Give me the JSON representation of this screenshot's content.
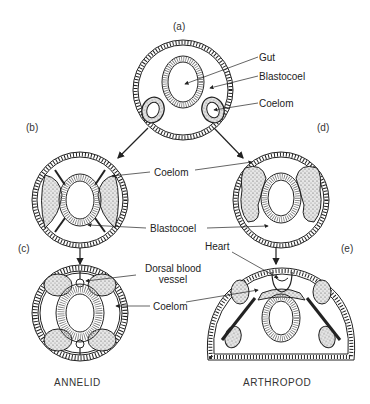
{
  "figure": {
    "panels": {
      "a": "(a)",
      "b": "(b)",
      "c": "(c)",
      "d": "(d)",
      "e": "(e)"
    },
    "labels": {
      "gut": "Gut",
      "blastocoel_a": "Blastocoel",
      "coelom_a": "Coelom",
      "coelom_bd": "Coelom",
      "blastocoel_bd": "Blastocoel",
      "heart": "Heart",
      "dorsal_blood_vessel_line1": "Dorsal blood",
      "dorsal_blood_vessel_line2": "vessel",
      "coelom_ce": "Coelom"
    },
    "captions": {
      "annelid": "ANNELID",
      "arthropod": "ARTHROPOD"
    },
    "colors": {
      "ink": "#222222",
      "background": "#ffffff",
      "stipple": "#d8d8d8"
    }
  }
}
